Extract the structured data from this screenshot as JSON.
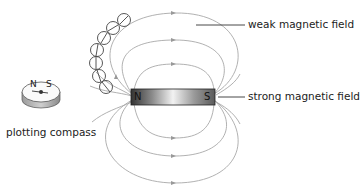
{
  "diagram": {
    "type": "bar magnet field lines",
    "magnet": {
      "north_label": "N",
      "south_label": "S"
    },
    "compass": {
      "north_label": "N",
      "south_label": "S",
      "caption": "plotting compass"
    },
    "labels": {
      "weak": "weak magnetic field",
      "strong": "strong magnetic field"
    },
    "colors": {
      "field_line": "#a8a8a8",
      "magnet_dark": "#3a3a3a",
      "magnet_light": "#f2f2f2",
      "compass_chain": "#444444"
    }
  }
}
